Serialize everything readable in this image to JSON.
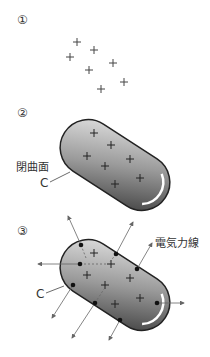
{
  "panels": [
    {
      "number": "①"
    },
    {
      "number": "②",
      "surface_label": "閉曲面",
      "curve_label": "C"
    },
    {
      "number": "③",
      "curve_label": "C",
      "field_label": "電気力線"
    }
  ],
  "charge_symbol": "+",
  "colors": {
    "capsule_dark": "#3a3a3a",
    "capsule_light": "#d8d8d8",
    "line": "#555555",
    "text": "#333333"
  }
}
